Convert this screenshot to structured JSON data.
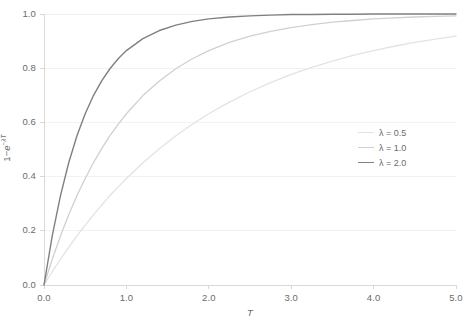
{
  "chart_data": {
    "type": "line",
    "title": "",
    "xlabel": "T",
    "ylabel": "1−e^(−λT)",
    "xlim": [
      0.0,
      5.0
    ],
    "ylim": [
      0.0,
      1.0
    ],
    "grid": true,
    "grid_axis": "y",
    "legend_position": "right-center",
    "xticks": [
      "0.0",
      "1.0",
      "2.0",
      "3.0",
      "4.0",
      "5.0"
    ],
    "xtick_values": [
      0.0,
      1.0,
      2.0,
      3.0,
      4.0,
      5.0
    ],
    "yticks": [
      "0.0",
      "0.2",
      "0.4",
      "0.6",
      "0.8",
      "1.0"
    ],
    "ytick_values": [
      0.0,
      0.2,
      0.4,
      0.6,
      0.8,
      1.0
    ],
    "x": [
      0.0,
      0.1,
      0.2,
      0.3,
      0.4,
      0.5,
      0.6,
      0.7,
      0.8,
      0.9,
      1.0,
      1.2,
      1.4,
      1.6,
      1.8,
      2.0,
      2.25,
      2.5,
      2.75,
      3.0,
      3.25,
      3.5,
      3.75,
      4.0,
      4.25,
      4.5,
      4.75,
      5.0
    ],
    "series": [
      {
        "name": "λ = 0.5",
        "lambda": 0.5,
        "color": "#e3e3e3",
        "width": 1.3,
        "values": [
          0.0,
          0.049,
          0.095,
          0.139,
          0.181,
          0.221,
          0.259,
          0.295,
          0.33,
          0.362,
          0.393,
          0.451,
          0.503,
          0.551,
          0.593,
          0.632,
          0.675,
          0.713,
          0.747,
          0.777,
          0.803,
          0.826,
          0.847,
          0.865,
          0.881,
          0.895,
          0.907,
          0.918
        ]
      },
      {
        "name": "λ = 1.0",
        "lambda": 1.0,
        "color": "#d0d0d0",
        "width": 1.3,
        "values": [
          0.0,
          0.095,
          0.181,
          0.259,
          0.33,
          0.393,
          0.451,
          0.503,
          0.551,
          0.593,
          0.632,
          0.699,
          0.753,
          0.798,
          0.835,
          0.865,
          0.895,
          0.918,
          0.936,
          0.95,
          0.961,
          0.97,
          0.976,
          0.982,
          0.986,
          0.989,
          0.991,
          0.993
        ]
      },
      {
        "name": "λ = 2.0",
        "lambda": 2.0,
        "color": "#808080",
        "width": 1.4,
        "values": [
          0.0,
          0.181,
          0.33,
          0.451,
          0.551,
          0.632,
          0.699,
          0.753,
          0.798,
          0.835,
          0.865,
          0.909,
          0.939,
          0.959,
          0.973,
          0.982,
          0.989,
          0.993,
          0.996,
          0.998,
          0.998,
          0.999,
          0.999,
          1.0,
          1.0,
          1.0,
          1.0,
          1.0
        ]
      }
    ],
    "axis_color": "#d9d9d9",
    "grid_color": "#f2f2f2",
    "plot_area": {
      "left": 44,
      "top": 14,
      "width": 412,
      "height": 271
    }
  }
}
